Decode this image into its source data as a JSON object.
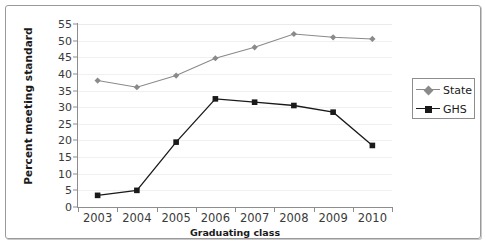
{
  "chart_data": {
    "type": "line",
    "title": "",
    "xlabel": "Graduating class",
    "ylabel": "Percent meeting standard",
    "categories": [
      "2003",
      "2004",
      "2005",
      "2006",
      "2007",
      "2008",
      "2009",
      "2010"
    ],
    "ylim": [
      0,
      55
    ],
    "yticks": [
      0,
      5,
      10,
      15,
      20,
      25,
      30,
      35,
      40,
      45,
      50,
      55
    ],
    "grid": true,
    "legend_position": "right",
    "series": [
      {
        "name": "State",
        "color": "#8a8a8a",
        "marker": "diamond",
        "values": [
          38,
          36,
          39.5,
          44.7,
          48,
          52,
          51,
          50.5
        ]
      },
      {
        "name": "GHS",
        "color": "#1a1a1a",
        "marker": "square",
        "values": [
          3.5,
          5,
          19.5,
          32.5,
          31.5,
          30.5,
          28.5,
          18.5
        ]
      }
    ]
  },
  "legend": {
    "items": [
      {
        "label": "State"
      },
      {
        "label": "GHS"
      }
    ]
  },
  "colors": {
    "state": "#8a8a8a",
    "ghs": "#1a1a1a",
    "axis": "#8d8d8d",
    "grid": "#f0f0f0",
    "frame": "#9a9a9a"
  }
}
